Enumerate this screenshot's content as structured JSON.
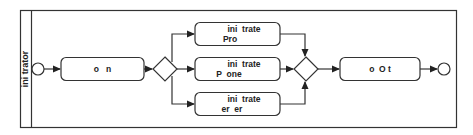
{
  "diagram": {
    "type": "bpmn-process",
    "pool": {
      "lane_label": "ini  trator"
    },
    "start_event": {
      "label": ""
    },
    "tasks": [
      {
        "id": "task-1",
        "line1": "o   n",
        "line2": ""
      },
      {
        "id": "task-top",
        "line1": "ini  trate",
        "line2": "Pro"
      },
      {
        "id": "task-middle",
        "line1": "ini  trate",
        "line2": "P  one"
      },
      {
        "id": "task-bottom",
        "line1": "ini  trate",
        "line2": "er  er"
      },
      {
        "id": "task-final",
        "line1": "o  O t",
        "line2": ""
      }
    ],
    "gateways": [
      {
        "id": "split-gateway",
        "kind": "parallel-split"
      },
      {
        "id": "join-gateway",
        "kind": "parallel-join"
      }
    ],
    "end_event": {
      "label": ""
    },
    "colors": {
      "stroke": "#333333",
      "fill": "#ffffff",
      "text": "#222222"
    }
  }
}
